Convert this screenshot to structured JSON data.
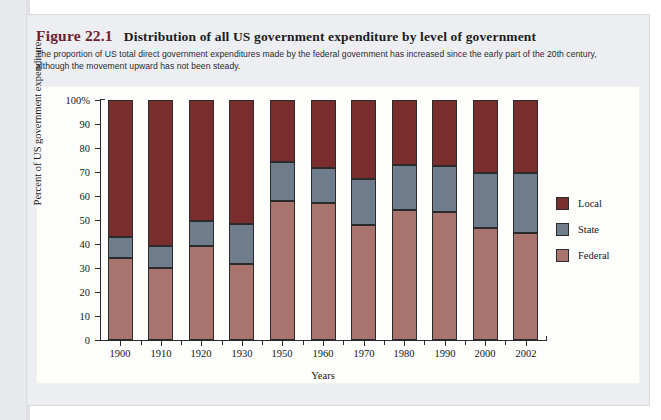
{
  "figure": {
    "label": "Figure 22.1",
    "title": "Distribution of all US government expenditure by level of government",
    "caption": "The proportion of US total direct government expenditures made by the federal government has increased since the early part of the 20th century, although the movement upward has not been steady."
  },
  "legend": {
    "position": "right",
    "items": [
      {
        "label": "Local",
        "color": "#7a2d2d"
      },
      {
        "label": "State",
        "color": "#6e7c8c"
      },
      {
        "label": "Federal",
        "color": "#a9736e"
      }
    ]
  },
  "axes": {
    "y_title": "Percent of US government expenditure",
    "x_title": "Years",
    "y_ticks": [
      "0",
      "10",
      "20",
      "30",
      "40",
      "50",
      "60",
      "70",
      "80",
      "90",
      "100%"
    ]
  },
  "chart_data": {
    "type": "bar",
    "subtype": "stacked-bar-100-percent",
    "title": "Distribution of all US government expenditure by level of government",
    "xlabel": "Years",
    "ylabel": "Percent of US government expenditure",
    "ylim": [
      0,
      100
    ],
    "ytick_values": [
      0,
      10,
      20,
      30,
      40,
      50,
      60,
      70,
      80,
      90,
      100
    ],
    "grid": false,
    "legend_position": "right",
    "categories": [
      "1900",
      "1910",
      "1920",
      "1930",
      "1950",
      "1960",
      "1970",
      "1980",
      "1990",
      "2000",
      "2002"
    ],
    "series": [
      {
        "name": "Federal",
        "color": "#a9736e",
        "values": [
          34,
          30,
          39,
          31.5,
          58,
          57,
          48,
          54,
          53.5,
          46.5,
          44.5
        ]
      },
      {
        "name": "State",
        "color": "#6e7c8c",
        "values": [
          9,
          9,
          10.5,
          17,
          16,
          14.5,
          19,
          19,
          19,
          23,
          25
        ]
      },
      {
        "name": "Local",
        "color": "#7a2d2d",
        "values": [
          57,
          61,
          50.5,
          51.5,
          26,
          28.5,
          33,
          27,
          27.5,
          30.5,
          30.5
        ]
      }
    ],
    "cumulative_tops": {
      "federal": [
        34,
        30,
        39,
        31.5,
        58,
        57,
        48,
        54,
        53.5,
        46.5,
        44.5
      ],
      "federal_plus_state": [
        43,
        39,
        49.5,
        48.5,
        74,
        71.5,
        67,
        73,
        72.5,
        69.5,
        69.5
      ],
      "total": [
        100,
        100,
        100,
        100,
        100,
        100,
        100,
        100,
        100,
        100,
        100
      ]
    }
  }
}
